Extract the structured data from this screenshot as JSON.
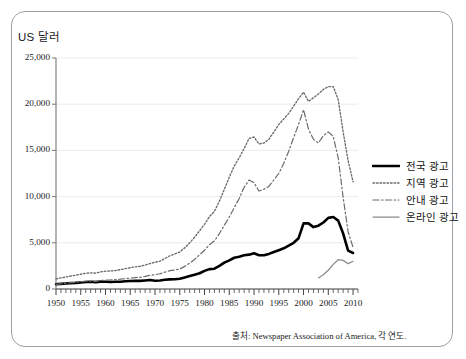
{
  "frame": {
    "border_color": "#9aa0a6"
  },
  "axis": {
    "y_title": "US 달러",
    "y_ticks": [
      "25,000",
      "20,000",
      "15,000",
      "10,000",
      "5,000",
      "0"
    ],
    "x_ticks": [
      "1950",
      "1955",
      "1960",
      "1965",
      "1970",
      "1975",
      "1980",
      "1985",
      "1990",
      "1995",
      "2000",
      "2005",
      "2010"
    ]
  },
  "legend": {
    "items": [
      {
        "label": "전국 광고",
        "style": "thick-solid",
        "color": "#000000"
      },
      {
        "label": "지역 광고",
        "style": "dotted",
        "color": "#6b6b6b"
      },
      {
        "label": "안내 광고",
        "style": "dash-dot",
        "color": "#6b6b6b"
      },
      {
        "label": "온라인 광고",
        "style": "thin-solid",
        "color": "#8a8a8a"
      }
    ]
  },
  "source": "출처: Newspaper Association of America, 각 연도.",
  "chart_data": {
    "type": "line",
    "title": "",
    "xlabel": "",
    "ylabel": "US 달러",
    "xlim": [
      1950,
      2011
    ],
    "ylim": [
      0,
      25000
    ],
    "grid": true,
    "legend_position": "right-outside",
    "x": [
      1950,
      1951,
      1952,
      1953,
      1954,
      1955,
      1956,
      1957,
      1958,
      1959,
      1960,
      1961,
      1962,
      1963,
      1964,
      1965,
      1966,
      1967,
      1968,
      1969,
      1970,
      1971,
      1972,
      1973,
      1974,
      1975,
      1976,
      1977,
      1978,
      1979,
      1980,
      1981,
      1982,
      1983,
      1984,
      1985,
      1986,
      1987,
      1988,
      1989,
      1990,
      1991,
      1992,
      1993,
      1994,
      1995,
      1996,
      1997,
      1998,
      1999,
      2000,
      2001,
      2002,
      2003,
      2004,
      2005,
      2006,
      2007,
      2008,
      2009,
      2010
    ],
    "series": [
      {
        "name": "전국 광고",
        "style": "thick-solid",
        "color": "#000000",
        "values": [
          518,
          560,
          600,
          640,
          660,
          712,
          760,
          780,
          740,
          800,
          778,
          760,
          790,
          790,
          840,
          860,
          890,
          880,
          920,
          970,
          891,
          920,
          1000,
          1040,
          1050,
          1109,
          1250,
          1400,
          1550,
          1700,
          1963,
          2150,
          2200,
          2500,
          2850,
          3100,
          3380,
          3500,
          3650,
          3720,
          3867,
          3650,
          3650,
          3800,
          4000,
          4200,
          4400,
          4700,
          5000,
          5500,
          7100,
          7100,
          6700,
          6850,
          7200,
          7700,
          7800,
          7400,
          6000,
          4150,
          3900
        ]
      },
      {
        "name": "지역 광고",
        "style": "dotted",
        "color": "#6b6b6b",
        "values": [
          1100,
          1200,
          1300,
          1400,
          1500,
          1600,
          1700,
          1750,
          1720,
          1850,
          1930,
          1950,
          2000,
          2100,
          2200,
          2300,
          2400,
          2450,
          2600,
          2750,
          2900,
          3000,
          3300,
          3600,
          3800,
          4000,
          4450,
          5000,
          5600,
          6300,
          7000,
          7850,
          8400,
          9500,
          10800,
          12100,
          13300,
          14200,
          15200,
          16300,
          16450,
          15700,
          15800,
          16200,
          17000,
          17800,
          18400,
          19000,
          19800,
          20600,
          21300,
          20300,
          20700,
          21100,
          21600,
          21900,
          21900,
          20500,
          17000,
          13900,
          11600
        ]
      },
      {
        "name": "안내 광고",
        "style": "dash-dot",
        "color": "#6b6b6b",
        "values": [
          500,
          560,
          620,
          680,
          720,
          790,
          840,
          860,
          830,
          920,
          960,
          980,
          1020,
          1060,
          1120,
          1180,
          1240,
          1260,
          1360,
          1480,
          1550,
          1650,
          1820,
          1980,
          2050,
          2160,
          2450,
          2800,
          3200,
          3700,
          4200,
          4800,
          5200,
          6000,
          6900,
          7800,
          8800,
          9800,
          11000,
          11800,
          11500,
          10600,
          10800,
          11100,
          11800,
          12500,
          13600,
          14900,
          16400,
          17800,
          19400,
          17300,
          16200,
          15800,
          16600,
          17000,
          16500,
          14200,
          9900,
          6200,
          4500
        ]
      },
      {
        "name": "온라인 광고",
        "style": "thin-solid",
        "color": "#8a8a8a",
        "values": [
          null,
          null,
          null,
          null,
          null,
          null,
          null,
          null,
          null,
          null,
          null,
          null,
          null,
          null,
          null,
          null,
          null,
          null,
          null,
          null,
          null,
          null,
          null,
          null,
          null,
          null,
          null,
          null,
          null,
          null,
          null,
          null,
          null,
          null,
          null,
          null,
          null,
          null,
          null,
          null,
          null,
          null,
          null,
          null,
          null,
          null,
          null,
          null,
          null,
          null,
          null,
          null,
          null,
          1200,
          1540,
          2030,
          2660,
          3170,
          3100,
          2740,
          3000
        ]
      }
    ]
  }
}
